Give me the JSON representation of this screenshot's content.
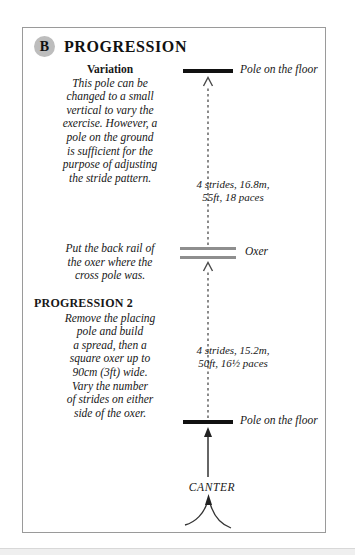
{
  "page": {
    "background_color": "#ffffff",
    "frame_border_color": "#9a9a9a"
  },
  "header": {
    "badge": "B",
    "badge_color": "#bdbdbd",
    "title": "PROGRESSION"
  },
  "blocks": {
    "variation": {
      "heading": "Variation",
      "lines": [
        "This pole can be",
        "changed to a small",
        "vertical to vary the",
        "exercise. However, a",
        "pole on the ground",
        "is sufficient for the",
        "purpose of adjusting",
        "the stride pattern."
      ]
    },
    "back_rail": {
      "lines": [
        "Put the back rail of",
        "the oxer where the",
        "cross pole was."
      ]
    },
    "progression2": {
      "heading": "PROGRESSION 2",
      "lines": [
        "Remove the placing",
        "pole and build",
        "a spread, then a",
        "square oxer up to",
        "90cm (3ft) wide.",
        "Vary the number",
        "of strides on either",
        "side of the oxer."
      ]
    }
  },
  "diagram": {
    "obstacles": [
      {
        "name": "pole-top",
        "label": "Pole on the floor",
        "color": "#111111"
      },
      {
        "name": "oxer",
        "label": "Oxer",
        "color": "#8e8e8e"
      },
      {
        "name": "pole-bottom",
        "label": "Pole on the floor",
        "color": "#111111"
      }
    ],
    "strides": [
      {
        "line1": "4 strides, 16.8m,",
        "line2": "55ft, 18 paces"
      },
      {
        "line1": "4 strides, 15.2m,",
        "line2": "50ft, 16½ paces"
      }
    ],
    "approach_label": "CANTER"
  }
}
